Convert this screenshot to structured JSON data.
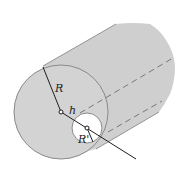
{
  "figure": {
    "labels": {
      "outer_radius": "R",
      "offset": "h",
      "hole_radius": "R'"
    },
    "colors": {
      "body_fill": "#cfcfcf",
      "outline": "#8a8a8a",
      "hole_fill": "#ffffff",
      "line": "#1e1e1e",
      "dashed": "#7a7a7a"
    }
  }
}
